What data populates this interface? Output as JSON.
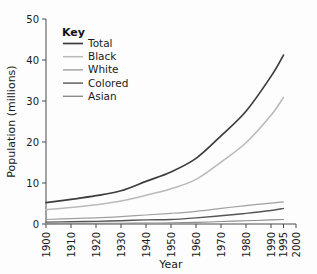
{
  "chart_data": {
    "type": "line",
    "title": "",
    "xlabel": "Year",
    "ylabel": "Population (millions)",
    "xlim": [
      1900,
      2000
    ],
    "ylim": [
      0,
      50
    ],
    "grid": false,
    "legend_position": "top-left",
    "legend_title": "Key",
    "x": [
      1900,
      1910,
      1920,
      1930,
      1940,
      1950,
      1960,
      1970,
      1980,
      1990,
      1995
    ],
    "xticks": [
      "1900",
      "1910",
      "1920",
      "1930",
      "1940",
      "1950",
      "1960",
      "1970",
      "1980",
      "1990",
      "1995",
      "2000"
    ],
    "xtick_values": [
      1900,
      1910,
      1920,
      1930,
      1940,
      1950,
      1960,
      1970,
      1980,
      1990,
      1995,
      2000
    ],
    "yticks": [
      "0",
      "10",
      "20",
      "30",
      "40",
      "50"
    ],
    "ytick_values": [
      0,
      10,
      20,
      30,
      40,
      50
    ],
    "series": [
      {
        "name": "Total",
        "color": "#3d3d3d",
        "width": 1.7,
        "values": [
          5.2,
          6.0,
          6.9,
          8.1,
          10.4,
          12.7,
          16.0,
          21.5,
          27.5,
          36.0,
          41.2
        ]
      },
      {
        "name": "Black",
        "color": "#b9b9b9",
        "width": 1.5,
        "values": [
          3.5,
          4.0,
          4.7,
          5.6,
          7.0,
          8.6,
          10.9,
          15.1,
          19.8,
          26.5,
          30.9
        ]
      },
      {
        "name": "White",
        "color": "#a0a0a0",
        "width": 1.2,
        "values": [
          1.1,
          1.3,
          1.5,
          1.8,
          2.2,
          2.6,
          3.1,
          3.8,
          4.5,
          5.1,
          5.4
        ]
      },
      {
        "name": "Colored",
        "color": "#565656",
        "width": 1.4,
        "values": [
          0.45,
          0.55,
          0.65,
          0.8,
          1.0,
          1.1,
          1.5,
          2.0,
          2.6,
          3.3,
          3.8
        ]
      },
      {
        "name": "Asian",
        "color": "#8c8c8c",
        "width": 1.1,
        "values": [
          0.1,
          0.13,
          0.16,
          0.2,
          0.23,
          0.3,
          0.4,
          0.6,
          0.8,
          1.0,
          1.1
        ]
      }
    ]
  }
}
